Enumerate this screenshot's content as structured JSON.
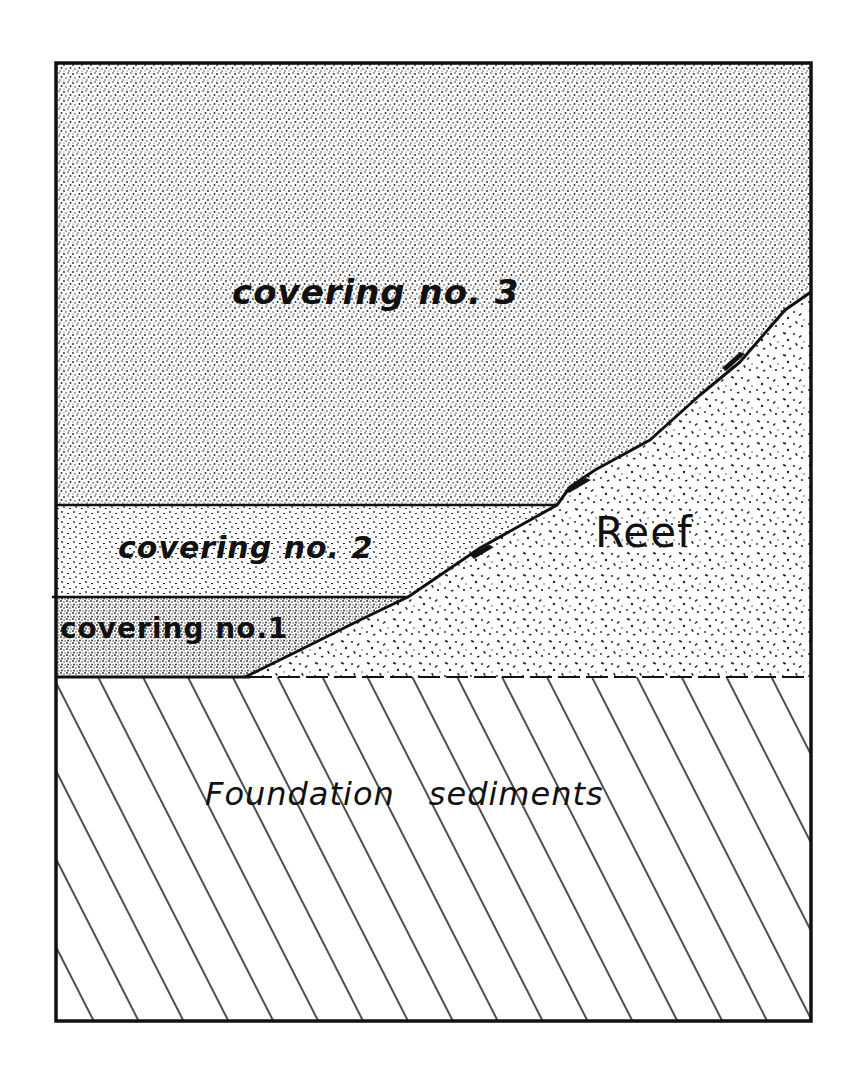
{
  "diagram": {
    "type": "geologic cross-section",
    "layers": {
      "covering_3": {
        "label": "covering no. 3",
        "pattern": "fine dense stipple"
      },
      "covering_2": {
        "label": "covering no. 2",
        "pattern": "medium stipple"
      },
      "covering_1": {
        "label": "covering no.1",
        "pattern": "dense stipple"
      },
      "reef": {
        "label": "Reef",
        "pattern": "coarse speckle"
      },
      "foundation": {
        "label_part1": "Foundation",
        "label_part2": "sediments",
        "pattern": "diagonal hatching"
      }
    },
    "colors": {
      "ink": "#111111",
      "paper": "#ffffff"
    }
  }
}
